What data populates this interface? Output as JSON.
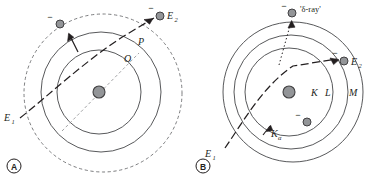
{
  "figure": {
    "background_color": "#ffffff",
    "line_color": "#58595b",
    "dark_line_color": "#231f20",
    "particle_fill": "#939598",
    "particle_stroke": "#414042"
  },
  "panel_a": {
    "letter": "A",
    "labels": {
      "incident": "E",
      "incident_sub": "1",
      "exit": "E",
      "exit_sub": "2",
      "orbit_outer": "P",
      "orbit_inner": "O",
      "ejected_electron_charge": "−",
      "exit_electron_charge": "−"
    },
    "orbits": [
      {
        "name": "O-shell",
        "radius": 42,
        "style": "solid"
      },
      {
        "name": "P-shell",
        "radius": 60,
        "style": "solid"
      },
      {
        "name": "outer-boundary",
        "radius": 79,
        "style": "dashed"
      }
    ],
    "nucleus": {
      "radius": 6
    },
    "description": "Incident particle E1 passes through outer shells, ejecting an electron; particle exits as E2"
  },
  "panel_b": {
    "letter": "B",
    "labels": {
      "incident": "E",
      "incident_sub": "1",
      "exit": "E",
      "exit_sub": "2",
      "shell_k": "K",
      "shell_l": "L",
      "shell_m": "M",
      "k_alpha": "K",
      "k_alpha_sub": "α",
      "delta_ray": "'δ-ray'",
      "delta_electron_charge": "−",
      "exit_electron_charge": "−",
      "orbit_electron_charge": "−"
    },
    "orbits": [
      {
        "name": "K-shell",
        "radius": 44,
        "style": "solid"
      },
      {
        "name": "L-shell",
        "radius": 57,
        "style": "solid"
      },
      {
        "name": "M-shell",
        "radius": 70,
        "style": "solid"
      }
    ],
    "nucleus": {
      "radius": 6
    },
    "description": "Incident particle E1 enters K shell, ejects a delta-ray electron, produces K-alpha emission, exits as E2"
  }
}
